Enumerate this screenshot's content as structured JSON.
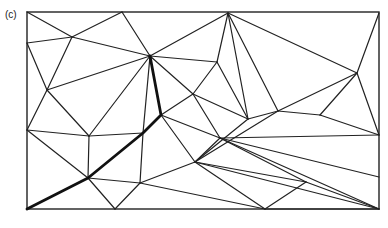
{
  "figure": {
    "panel_label": "(c)",
    "colors": {
      "stroke": "#222222",
      "background": "#ffffff"
    },
    "frame": {
      "x": 27,
      "y": 12,
      "width": 352,
      "height": 197
    },
    "vertices": {
      "A": [
        27,
        12
      ],
      "B": [
        122,
        12
      ],
      "C": [
        228,
        13
      ],
      "D": [
        379,
        13
      ],
      "E": [
        72,
        37
      ],
      "F": [
        27,
        43
      ],
      "G": [
        150,
        56
      ],
      "H": [
        217,
        62
      ],
      "I": [
        47,
        90
      ],
      "J": [
        357,
        73
      ],
      "K": [
        27,
        130
      ],
      "L": [
        89,
        136
      ],
      "M": [
        193,
        94
      ],
      "N": [
        320,
        115
      ],
      "O": [
        161,
        115
      ],
      "P": [
        278,
        111
      ],
      "Q": [
        248,
        119
      ],
      "R": [
        379,
        135
      ],
      "S": [
        143,
        133
      ],
      "T": [
        195,
        162
      ],
      "U": [
        88,
        178
      ],
      "V": [
        140,
        183
      ],
      "W": [
        220,
        138
      ],
      "X": [
        306,
        182
      ],
      "Y": [
        379,
        177
      ],
      "Z": [
        27,
        209
      ],
      "AA": [
        115,
        209
      ],
      "AB": [
        265,
        209
      ],
      "AC": [
        379,
        209
      ]
    },
    "edges": [
      [
        "A",
        "E"
      ],
      [
        "E",
        "B"
      ],
      [
        "B",
        "G"
      ],
      [
        "E",
        "G"
      ],
      [
        "E",
        "F"
      ],
      [
        "F",
        "I"
      ],
      [
        "E",
        "I"
      ],
      [
        "G",
        "C"
      ],
      [
        "C",
        "H"
      ],
      [
        "G",
        "H"
      ],
      [
        "G",
        "I"
      ],
      [
        "I",
        "K"
      ],
      [
        "I",
        "L"
      ],
      [
        "G",
        "L"
      ],
      [
        "G",
        "S"
      ],
      [
        "G",
        "O"
      ],
      [
        "H",
        "M"
      ],
      [
        "G",
        "M"
      ],
      [
        "M",
        "O"
      ],
      [
        "M",
        "W"
      ],
      [
        "M",
        "Q"
      ],
      [
        "H",
        "Q"
      ],
      [
        "C",
        "Q"
      ],
      [
        "C",
        "P"
      ],
      [
        "D",
        "J"
      ],
      [
        "J",
        "P"
      ],
      [
        "C",
        "J"
      ],
      [
        "J",
        "N"
      ],
      [
        "P",
        "N"
      ],
      [
        "N",
        "R"
      ],
      [
        "J",
        "R"
      ],
      [
        "Q",
        "P"
      ],
      [
        "Q",
        "T"
      ],
      [
        "O",
        "T"
      ],
      [
        "P",
        "T"
      ],
      [
        "T",
        "W"
      ],
      [
        "W",
        "R"
      ],
      [
        "W",
        "Y"
      ],
      [
        "W",
        "X"
      ],
      [
        "T",
        "X"
      ],
      [
        "T",
        "AC"
      ],
      [
        "W",
        "AC"
      ],
      [
        "K",
        "L"
      ],
      [
        "L",
        "S"
      ],
      [
        "S",
        "O"
      ],
      [
        "K",
        "U"
      ],
      [
        "L",
        "U"
      ],
      [
        "S",
        "V"
      ],
      [
        "U",
        "V"
      ],
      [
        "V",
        "T"
      ],
      [
        "V",
        "AB"
      ],
      [
        "T",
        "AB"
      ],
      [
        "AB",
        "AC"
      ],
      [
        "X",
        "AC"
      ],
      [
        "U",
        "AA"
      ],
      [
        "V",
        "AA"
      ],
      [
        "X",
        "AB"
      ],
      [
        "O",
        "W"
      ]
    ],
    "highlight_path": [
      "Z",
      "U",
      "S",
      "O",
      "G"
    ]
  }
}
